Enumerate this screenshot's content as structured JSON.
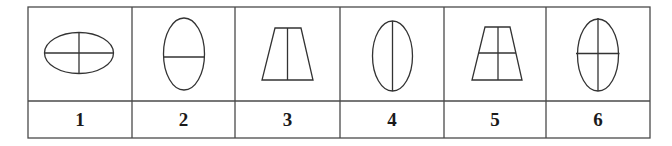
{
  "table": {
    "columns": [
      {
        "label": "1",
        "figure": "horizontal ellipse divided by horizontal and vertical line into four parts",
        "left": 28,
        "right": 132
      },
      {
        "label": "2",
        "figure": "vertical ellipse divided by horizontal line",
        "left": 132,
        "right": 235
      },
      {
        "label": "3",
        "figure": "trapezoid divided by vertical line",
        "left": 235,
        "right": 340
      },
      {
        "label": "4",
        "figure": "vertical ellipse divided by vertical line",
        "left": 340,
        "right": 444
      },
      {
        "label": "5",
        "figure": "trapezoid divided by horizontal and vertical line into four parts",
        "left": 444,
        "right": 546
      },
      {
        "label": "6",
        "figure": "vertical ellipse divided by horizontal and vertical line into four parts",
        "left": 546,
        "right": 650
      }
    ],
    "border_color": "#4a4a4a",
    "stroke_color": "#333333"
  }
}
